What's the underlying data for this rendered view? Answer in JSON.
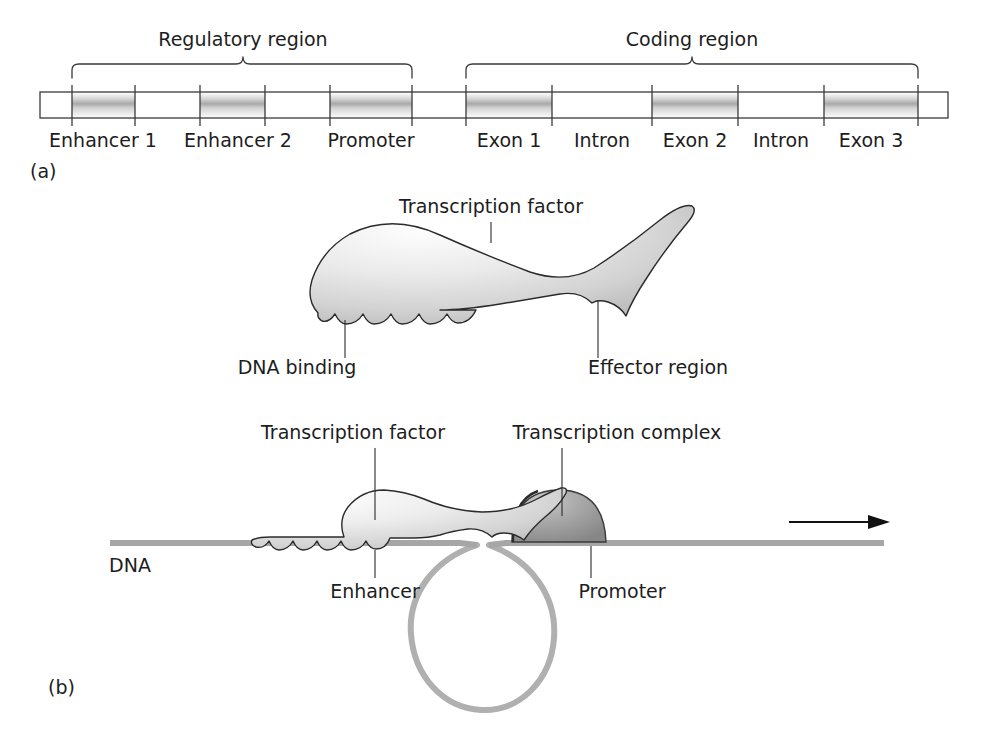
{
  "figure": {
    "panels": [
      {
        "id": "a",
        "label": "(a)"
      },
      {
        "id": "b",
        "label": "(b)"
      }
    ]
  },
  "panel_a": {
    "braces": [
      {
        "name": "regulatory",
        "label": "Regulatory region",
        "x_start": 72,
        "x_end": 412,
        "label_x": 243,
        "label_y": 46
      },
      {
        "name": "coding",
        "label": "Coding region",
        "x_start": 466,
        "x_end": 918,
        "label_x": 692,
        "label_y": 46
      }
    ],
    "gene_bar": {
      "x": 40,
      "y": 92,
      "width": 908,
      "height": 26,
      "fill": "#ffffff",
      "stroke": "#3a3a3a"
    },
    "segments": [
      {
        "name": "enhancer-1",
        "label": "Enhancer 1",
        "x_start": 72,
        "x_end": 135,
        "shaded": true,
        "label_x": 103,
        "label_y": 141
      },
      {
        "name": "spacer-1",
        "label": "",
        "x_start": 135,
        "x_end": 200,
        "shaded": false,
        "label_x": 0,
        "label_y": 0
      },
      {
        "name": "enhancer-2",
        "label": "Enhancer 2",
        "x_start": 200,
        "x_end": 265,
        "shaded": true,
        "label_x": 238,
        "label_y": 141
      },
      {
        "name": "spacer-2",
        "label": "",
        "x_start": 265,
        "x_end": 330,
        "shaded": false,
        "label_x": 0,
        "label_y": 0
      },
      {
        "name": "promoter",
        "label": "Promoter",
        "x_start": 330,
        "x_end": 412,
        "shaded": true,
        "label_x": 371,
        "label_y": 141
      },
      {
        "name": "spacer-3",
        "label": "",
        "x_start": 412,
        "x_end": 466,
        "shaded": false,
        "label_x": 0,
        "label_y": 0
      },
      {
        "name": "exon-1",
        "label": "Exon 1",
        "x_start": 466,
        "x_end": 552,
        "shaded": true,
        "label_x": 509,
        "label_y": 141
      },
      {
        "name": "intron-1",
        "label": "Intron",
        "x_start": 552,
        "x_end": 652,
        "shaded": false,
        "label_x": 602,
        "label_y": 141
      },
      {
        "name": "exon-2",
        "label": "Exon 2",
        "x_start": 652,
        "x_end": 738,
        "shaded": true,
        "label_x": 695,
        "label_y": 141
      },
      {
        "name": "intron-2",
        "label": "Intron",
        "x_start": 738,
        "x_end": 824,
        "shaded": false,
        "label_x": 781,
        "label_y": 141
      },
      {
        "name": "exon-3",
        "label": "Exon 3",
        "x_start": 824,
        "x_end": 918,
        "shaded": true,
        "label_x": 871,
        "label_y": 141
      }
    ],
    "panel_label": {
      "text": "(a)",
      "x": 30,
      "y": 172
    }
  },
  "panel_b_upper": {
    "title_label": {
      "text": "Transcription factor",
      "x": 491,
      "y": 213
    },
    "dna_binding_label": {
      "text": "DNA binding",
      "x": 297,
      "y": 374
    },
    "effector_label": {
      "text": "Effector region",
      "x": 658,
      "y": 374
    },
    "leaders": [
      {
        "name": "transcription-factor-leader",
        "x1": 491,
        "y1": 222,
        "x2": 491,
        "y2": 243
      },
      {
        "name": "dna-binding-leader",
        "x1": 345,
        "y1": 318,
        "x2": 345,
        "y2": 358
      },
      {
        "name": "effector-leader",
        "x1": 598,
        "y1": 295,
        "x2": 598,
        "y2": 358
      }
    ],
    "scallop_count": 6
  },
  "panel_b_lower": {
    "transcription_factor_label": {
      "text": "Transcription factor",
      "x": 353,
      "y": 439
    },
    "transcription_complex_label": {
      "text": "Transcription complex",
      "x": 617,
      "y": 439
    },
    "enhancer_label": {
      "text": "Enhancer",
      "x": 375,
      "y": 594
    },
    "promoter_label": {
      "text": "Promoter",
      "x": 622,
      "y": 594
    },
    "dna_label": {
      "text": "DNA",
      "x": 130,
      "y": 570
    },
    "leaders": [
      {
        "name": "tf-lower-leader",
        "x1": 375,
        "y1": 448,
        "x2": 375,
        "y2": 520
      },
      {
        "name": "complex-leader",
        "x1": 562,
        "y1": 448,
        "x2": 562,
        "y2": 516
      },
      {
        "name": "enhancer-leader",
        "x1": 375,
        "y1": 548,
        "x2": 375,
        "y2": 578
      },
      {
        "name": "promoter-leader",
        "x1": 591,
        "y1": 545,
        "x2": 591,
        "y2": 578
      }
    ],
    "dna_strand": {
      "x_start": 110,
      "x_end": 884,
      "y": 543,
      "color": "#a6a6a6"
    },
    "arrow": {
      "x_start": 789,
      "x_end": 884,
      "y": 522
    },
    "loop": {
      "color": "#b0b0b0"
    },
    "complex_dome": {
      "fill_light": "#b9b9b9",
      "fill_dark": "#8f8f8f"
    }
  },
  "colors": {
    "ink": "#1d1d1d",
    "outline": "#2b2b2b",
    "dna": "#a6a6a6",
    "loop": "#b0b0b0",
    "shade_light": "#f2f2f2",
    "shade_mid": "#c9c9c9",
    "complex": "#9a9a9a"
  }
}
